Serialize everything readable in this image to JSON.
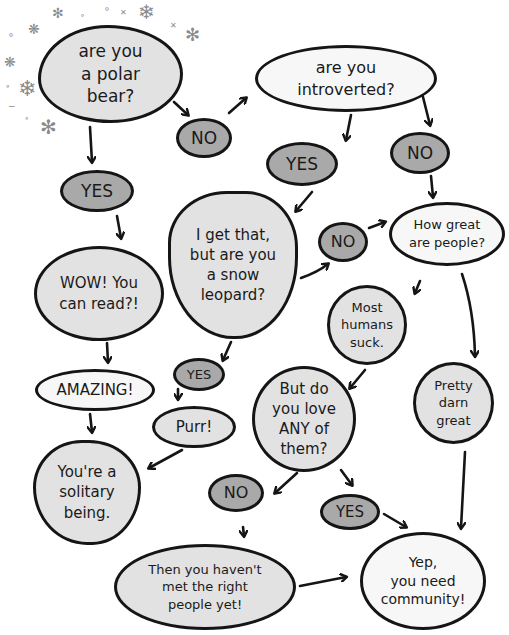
{
  "nodes": [
    {
      "id": "q-polar-bear",
      "text": "are you\na polar\nbear?",
      "x": 38,
      "y": 25,
      "w": 145,
      "h": 98,
      "r": "48% 52% 50% 50% / 55% 50% 50% 45%",
      "fill": "light",
      "fs": 17
    },
    {
      "id": "q-introverted",
      "text": "are you\nintroverted?",
      "x": 255,
      "y": 45,
      "w": 182,
      "h": 67,
      "r": "50%",
      "fill": "white",
      "fs": 16
    },
    {
      "id": "no-1",
      "text": "NO",
      "x": 176,
      "y": 118,
      "w": 56,
      "h": 40,
      "r": "50%",
      "fill": "dark",
      "fs": 17
    },
    {
      "id": "yes-1",
      "text": "YES",
      "x": 266,
      "y": 142,
      "w": 72,
      "h": 44,
      "r": "50%",
      "fill": "dark",
      "fs": 17
    },
    {
      "id": "no-2",
      "text": "NO",
      "x": 390,
      "y": 132,
      "w": 60,
      "h": 42,
      "r": "50%",
      "fill": "dark",
      "fs": 17
    },
    {
      "id": "yes-2",
      "text": "YES",
      "x": 60,
      "y": 170,
      "w": 74,
      "h": 42,
      "r": "50%",
      "fill": "dark",
      "fs": 17
    },
    {
      "id": "q-snow-leopard",
      "text": "I get that,\nbut are you\na snow\nleopard?",
      "x": 168,
      "y": 191,
      "w": 130,
      "h": 148,
      "r": "45% 40% 48% 50% / 35% 38% 55% 55%",
      "fill": "light",
      "fs": 15
    },
    {
      "id": "no-3",
      "text": "NO",
      "x": 318,
      "y": 222,
      "w": 50,
      "h": 40,
      "r": "50%",
      "fill": "dark",
      "fs": 16
    },
    {
      "id": "q-how-great",
      "text": "How great\nare people?",
      "x": 389,
      "y": 202,
      "w": 116,
      "h": 64,
      "r": "50%",
      "fill": "white",
      "fs": 13
    },
    {
      "id": "wow",
      "text": "WOW! You\ncan read?!",
      "x": 34,
      "y": 246,
      "w": 130,
      "h": 95,
      "r": "50%",
      "fill": "light",
      "fs": 15
    },
    {
      "id": "most-humans",
      "text": "Most\nhumans\nsuck.",
      "x": 327,
      "y": 285,
      "w": 80,
      "h": 80,
      "r": "50%",
      "fill": "light",
      "fs": 13
    },
    {
      "id": "yes-3",
      "text": "YES",
      "x": 173,
      "y": 358,
      "w": 52,
      "h": 33,
      "r": "50%",
      "fill": "dark",
      "fs": 13
    },
    {
      "id": "amazing",
      "text": "AMAZING!",
      "x": 35,
      "y": 369,
      "w": 120,
      "h": 42,
      "r": "50%",
      "fill": "white",
      "fs": 15
    },
    {
      "id": "pretty-darn-great",
      "text": "Pretty\ndarn\ngreat",
      "x": 413,
      "y": 362,
      "w": 81,
      "h": 82,
      "r": "50%",
      "fill": "light",
      "fs": 13
    },
    {
      "id": "q-love-any",
      "text": "But do\nyou love\nANY of\nthem?",
      "x": 252,
      "y": 366,
      "w": 104,
      "h": 106,
      "r": "50%",
      "fill": "light",
      "fs": 15
    },
    {
      "id": "purr",
      "text": "Purr!",
      "x": 152,
      "y": 406,
      "w": 84,
      "h": 42,
      "r": "50%",
      "fill": "light",
      "fs": 15
    },
    {
      "id": "solitary",
      "text": "You're a\nsolitary\nbeing.",
      "x": 33,
      "y": 440,
      "w": 108,
      "h": 105,
      "r": "45% 48% 45% 50% / 45% 45% 55% 55%",
      "fill": "light",
      "fs": 15
    },
    {
      "id": "no-4",
      "text": "NO",
      "x": 208,
      "y": 474,
      "w": 56,
      "h": 38,
      "r": "50%",
      "fill": "dark",
      "fs": 16
    },
    {
      "id": "yes-4",
      "text": "YES",
      "x": 320,
      "y": 494,
      "w": 60,
      "h": 36,
      "r": "50%",
      "fill": "dark",
      "fs": 15
    },
    {
      "id": "havent-met",
      "text": "Then you haven't\nmet the right\npeople yet!",
      "x": 114,
      "y": 544,
      "w": 182,
      "h": 86,
      "r": "50%",
      "fill": "light",
      "fs": 13
    },
    {
      "id": "need-community",
      "text": "Yep,\nyou need\ncommunity!",
      "x": 360,
      "y": 532,
      "w": 126,
      "h": 98,
      "r": "50%",
      "fill": "white",
      "fs": 14
    }
  ],
  "arrows": [
    {
      "from": "q-polar-bear",
      "to": "no-1",
      "d": "M174,102 L188,115"
    },
    {
      "from": "no-1",
      "to": "q-introverted",
      "d": "M229,113 L246,98"
    },
    {
      "from": "q-polar-bear",
      "to": "yes-2",
      "d": "M90,127 L92,162"
    },
    {
      "from": "q-introverted",
      "to": "yes-1",
      "d": "M351,115 L346,140"
    },
    {
      "from": "q-introverted",
      "to": "no-2",
      "d": "M422,93 L430,125"
    },
    {
      "from": "no-2",
      "to": "q-how-great",
      "d": "M431,176 L433,197"
    },
    {
      "from": "yes-1",
      "to": "q-snow-leopard",
      "d": "M312,192 L296,211"
    },
    {
      "from": "q-snow-leopard",
      "to": "no-3",
      "d": "M301,278 Q318,272 328,264"
    },
    {
      "from": "no-3",
      "to": "q-how-great",
      "d": "M369,228 L385,222"
    },
    {
      "from": "yes-2",
      "to": "wow",
      "d": "M117,216 L121,238"
    },
    {
      "from": "q-how-great",
      "to": "most-humans",
      "d": "M420,281 L415,293"
    },
    {
      "from": "q-how-great",
      "to": "pretty-darn-great",
      "d": "M462,274 Q474,310 475,356"
    },
    {
      "from": "wow",
      "to": "amazing",
      "d": "M107,343 L108,362"
    },
    {
      "from": "q-snow-leopard",
      "to": "yes-3",
      "d": "M231,342 L223,360"
    },
    {
      "from": "yes-3",
      "to": "purr",
      "d": "M178,389 L178,399"
    },
    {
      "from": "most-humans",
      "to": "q-love-any",
      "d": "M365,370 L350,388"
    },
    {
      "from": "amazing",
      "to": "solitary",
      "d": "M90,414 L92,432"
    },
    {
      "from": "purr",
      "to": "solitary",
      "d": "M182,450 L149,468"
    },
    {
      "from": "q-love-any",
      "to": "no-4",
      "d": "M297,473 L275,493"
    },
    {
      "from": "q-love-any",
      "to": "yes-4",
      "d": "M341,470 L352,485"
    },
    {
      "from": "no-4",
      "to": "havent-met",
      "d": "M243,527 L244,536"
    },
    {
      "from": "yes-4",
      "to": "need-community",
      "d": "M384,514 L406,527"
    },
    {
      "from": "pretty-darn-great",
      "to": "need-community",
      "d": "M465,452 L461,528"
    },
    {
      "from": "havent-met",
      "to": "need-community",
      "d": "M300,586 L346,577"
    }
  ],
  "snowflakes": [
    {
      "x": 52,
      "y": 6,
      "g": "✻",
      "s": 14
    },
    {
      "x": 138,
      "y": 2,
      "g": "❄",
      "s": 20
    },
    {
      "x": 185,
      "y": 26,
      "g": "✻",
      "s": 18
    },
    {
      "x": 28,
      "y": 22,
      "g": "❋",
      "s": 14
    },
    {
      "x": 4,
      "y": 55,
      "g": "❋",
      "s": 14
    },
    {
      "x": 18,
      "y": 78,
      "g": "❄",
      "s": 22
    },
    {
      "x": 40,
      "y": 117,
      "g": "✻",
      "s": 20
    },
    {
      "x": 8,
      "y": 30,
      "g": "∘",
      "s": 10
    },
    {
      "x": 104,
      "y": 4,
      "g": "∘",
      "s": 10
    },
    {
      "x": 120,
      "y": 9,
      "g": "✕",
      "s": 8
    },
    {
      "x": 80,
      "y": 12,
      "g": "∘",
      "s": 8
    },
    {
      "x": 170,
      "y": 22,
      "g": "✕",
      "s": 8
    },
    {
      "x": 5,
      "y": 82,
      "g": "∘",
      "s": 9
    },
    {
      "x": 24,
      "y": 114,
      "g": "∘",
      "s": 9
    },
    {
      "x": 8,
      "y": 102,
      "g": "−",
      "s": 9
    }
  ]
}
